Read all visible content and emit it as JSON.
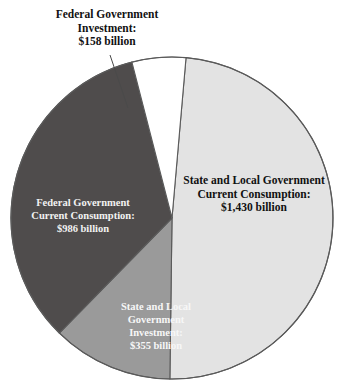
{
  "chart_data": {
    "type": "pie",
    "title": "",
    "subtitle": "",
    "xlabel": "",
    "ylabel": "",
    "units": "billion dollars",
    "total": 2929,
    "legend_position": "none",
    "grid": false,
    "categories": [
      "State and Local Government Current Consumption",
      "State and Local Government Investment",
      "Federal Government Current Consumption",
      "Federal Government Investment"
    ],
    "values": [
      1430,
      355,
      986,
      158
    ],
    "value_labels": [
      "$1,430 billion",
      "$355 billion",
      "$986 billion",
      "$158 billion"
    ],
    "colors": [
      "#e3e3e3",
      "#9a9a9a",
      "#4f4c4c",
      "#ffffff"
    ],
    "slices": [
      {
        "name": "State and Local Government Current Consumption",
        "value": 1430,
        "value_label": "$1,430 billion",
        "percent": 48.8,
        "color": "#e3e3e3",
        "label_placement": "inside",
        "label_color": "#111111"
      },
      {
        "name": "State and Local Government Investment",
        "value": 355,
        "value_label": "$355 billion",
        "percent": 12.1,
        "color": "#9a9a9a",
        "label_placement": "inside",
        "label_color": "#f7f7f7"
      },
      {
        "name": "Federal Government Current Consumption",
        "value": 986,
        "value_label": "$986 billion",
        "percent": 33.7,
        "color": "#4f4c4c",
        "label_placement": "inside",
        "label_color": "#f2f2f2"
      },
      {
        "name": "Federal Government Investment",
        "value": 158,
        "value_label": "$158 billion",
        "percent": 5.4,
        "color": "#ffffff",
        "label_placement": "callout",
        "label_color": "#111111"
      }
    ]
  },
  "labels": {
    "federal_investment": {
      "line1": "Federal Government",
      "line2": "Investment:",
      "line3": "$158 billion"
    },
    "sl_consumption": {
      "line1": "State and Local Government",
      "line2": "Current Consumption:",
      "line3": "$1,430 billion"
    },
    "federal_consumption": {
      "line1": "Federal Government",
      "line2": "Current Consumption:",
      "line3": "$986 billion"
    },
    "sl_investment": {
      "line1": "State and Local",
      "line2": "Government",
      "line3": "Investment:",
      "line4": "$355 billion"
    }
  },
  "style": {
    "outline_color": "#5a5a5a",
    "background": "#ffffff"
  }
}
